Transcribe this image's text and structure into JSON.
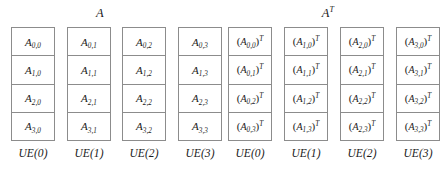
{
  "figure": {
    "title_a": "A",
    "title_at_base": "A",
    "title_at_sup": "T",
    "groups": [
      {
        "id": "matrix-a",
        "label": "A",
        "columns": [
          {
            "ue": "UE(0)",
            "cells": [
              {
                "base": "A",
                "sub": "0,0"
              },
              {
                "base": "A",
                "sub": "1,0"
              },
              {
                "base": "A",
                "sub": "2,0"
              },
              {
                "base": "A",
                "sub": "3,0"
              }
            ]
          },
          {
            "ue": "UE(1)",
            "cells": [
              {
                "base": "A",
                "sub": "0,1"
              },
              {
                "base": "A",
                "sub": "1,1"
              },
              {
                "base": "A",
                "sub": "2,1"
              },
              {
                "base": "A",
                "sub": "3,1"
              }
            ]
          },
          {
            "ue": "UE(2)",
            "cells": [
              {
                "base": "A",
                "sub": "0,2"
              },
              {
                "base": "A",
                "sub": "1,2"
              },
              {
                "base": "A",
                "sub": "2,2"
              },
              {
                "base": "A",
                "sub": "3,2"
              }
            ]
          },
          {
            "ue": "UE(3)",
            "cells": [
              {
                "base": "A",
                "sub": "0,3"
              },
              {
                "base": "A",
                "sub": "1,3"
              },
              {
                "base": "A",
                "sub": "2,3"
              },
              {
                "base": "A",
                "sub": "3,3"
              }
            ]
          }
        ]
      },
      {
        "id": "matrix-a-transpose",
        "label": "A^T",
        "columns": [
          {
            "ue": "UE(0)",
            "cells": [
              {
                "base": "A",
                "sub": "0,0",
                "sup": "T",
                "paren": true
              },
              {
                "base": "A",
                "sub": "0,1",
                "sup": "T",
                "paren": true
              },
              {
                "base": "A",
                "sub": "0,2",
                "sup": "T",
                "paren": true
              },
              {
                "base": "A",
                "sub": "0,3",
                "sup": "T",
                "paren": true
              }
            ]
          },
          {
            "ue": "UE(1)",
            "cells": [
              {
                "base": "A",
                "sub": "1,0",
                "sup": "T",
                "paren": true
              },
              {
                "base": "A",
                "sub": "1,1",
                "sup": "T",
                "paren": true
              },
              {
                "base": "A",
                "sub": "1,2",
                "sup": "T",
                "paren": true
              },
              {
                "base": "A",
                "sub": "1,3",
                "sup": "T",
                "paren": true
              }
            ]
          },
          {
            "ue": "UE(2)",
            "cells": [
              {
                "base": "A",
                "sub": "2,0",
                "sup": "T",
                "paren": true
              },
              {
                "base": "A",
                "sub": "2,1",
                "sup": "T",
                "paren": true
              },
              {
                "base": "A",
                "sub": "2,2",
                "sup": "T",
                "paren": true
              },
              {
                "base": "A",
                "sub": "2,3",
                "sup": "T",
                "paren": true
              }
            ]
          },
          {
            "ue": "UE(3)",
            "cells": [
              {
                "base": "A",
                "sub": "3,0",
                "sup": "T",
                "paren": true
              },
              {
                "base": "A",
                "sub": "3,1",
                "sup": "T",
                "paren": true
              },
              {
                "base": "A",
                "sub": "3,2",
                "sup": "T",
                "paren": true
              },
              {
                "base": "A",
                "sub": "3,3",
                "sup": "T",
                "paren": true
              }
            ]
          }
        ]
      }
    ],
    "colors": {
      "background": "#ffffff",
      "border": "#8c8c8c",
      "text": "#1a1a1a"
    }
  }
}
